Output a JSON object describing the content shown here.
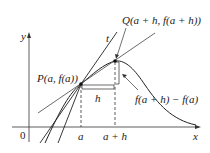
{
  "diagram": {
    "axes": {
      "x_label": "x",
      "y_label": "y",
      "origin_label": "0"
    },
    "points": {
      "P": {
        "label": "P(a, f(a))"
      },
      "Q": {
        "label": "Q(a + h, f(a + h))"
      }
    },
    "tick_labels": {
      "a": "a",
      "a_plus_h": "a + h"
    },
    "tangent_label": "t",
    "increment_label": "h",
    "rise_label": "f(a + h) − f(a)",
    "colors": {
      "line": "#222222",
      "background": "#ffffff"
    }
  }
}
